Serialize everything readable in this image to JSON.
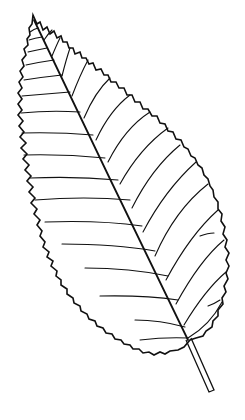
{
  "image": {
    "subject": "leaf line drawing",
    "style": "black ink line art on white",
    "colors": {
      "background": "#ffffff",
      "ink": "#111111"
    }
  }
}
